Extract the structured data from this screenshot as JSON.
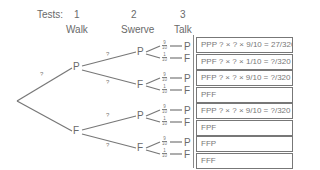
{
  "header": {
    "tests_label": "Tests:",
    "stages": [
      {
        "number": "1",
        "name": "Walk"
      },
      {
        "number": "2",
        "name": "Swerve"
      },
      {
        "number": "3",
        "name": "Talk"
      }
    ]
  },
  "tree": {
    "level1": [
      {
        "node": "P",
        "prob": "?"
      },
      {
        "node": "F",
        "prob": "?"
      }
    ],
    "level2": [
      {
        "node": "P",
        "prob": "?"
      },
      {
        "node": "F",
        "prob": "?"
      },
      {
        "node": "P",
        "prob": "?"
      },
      {
        "node": "F",
        "prob": "?"
      }
    ],
    "level3": [
      {
        "node": "P",
        "num": "9",
        "den": "10"
      },
      {
        "node": "F",
        "num": "1",
        "den": "10"
      },
      {
        "node": "P",
        "num": "9",
        "den": "10"
      },
      {
        "node": "F",
        "num": "1",
        "den": "10"
      },
      {
        "node": "P",
        "num": "9",
        "den": "10"
      },
      {
        "node": "F",
        "num": "1",
        "den": "10"
      },
      {
        "node": "P",
        "num": "9",
        "den": "10"
      },
      {
        "node": "F",
        "num": "1",
        "den": "10"
      }
    ]
  },
  "outcomes": [
    {
      "label": "PPP",
      "expr": "? × ? × 9/10 = 27/320"
    },
    {
      "label": "PPF",
      "expr": "? × ? × 1/10 = ?/320"
    },
    {
      "label": "PFP",
      "expr": "? × ? × 9/10 = ?/320"
    },
    {
      "label": "PFF",
      "expr": ""
    },
    {
      "label": "FPP",
      "expr": "? × ? × 9/10 = ?/320"
    },
    {
      "label": "FPF",
      "expr": ""
    },
    {
      "label": "FFP",
      "expr": ""
    },
    {
      "label": "FFF",
      "expr": ""
    }
  ]
}
